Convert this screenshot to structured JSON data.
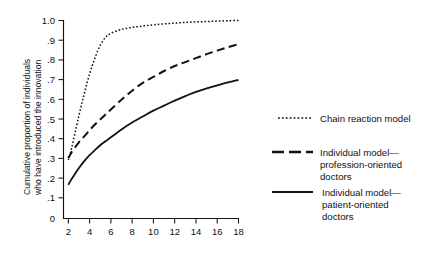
{
  "chart_data": {
    "type": "line",
    "title": "",
    "subtitle": "",
    "xlabel": "",
    "ylabel": "Cumulative proportion of individuals who have introduced the innovation",
    "ylabel_line1": "Cumulative proportion of individuals",
    "ylabel_line2": "who have introduced the innovation",
    "xlim": [
      0,
      19
    ],
    "ylim": [
      0,
      1.0
    ],
    "grid": false,
    "legend_position": "right",
    "x_ticks": [
      2,
      4,
      6,
      8,
      10,
      12,
      14,
      16,
      18
    ],
    "x_tick_labels": [
      "2",
      "4",
      "6",
      "8",
      "10",
      "12",
      "14",
      "16",
      "18"
    ],
    "y_ticks": [
      0,
      0.1,
      0.2,
      0.3,
      0.4,
      0.5,
      0.6,
      0.7,
      0.8,
      0.9,
      1.0
    ],
    "y_tick_labels": [
      "0",
      ".1",
      ".2",
      ".3",
      ".4",
      ".5",
      ".6",
      ".7",
      ".8",
      ".9",
      "1.0"
    ],
    "x": [
      2,
      2.2,
      2.5,
      3,
      3.5,
      4,
      4.5,
      5,
      5.5,
      6,
      7,
      8,
      9,
      10,
      11,
      12,
      13,
      14,
      15,
      16,
      17,
      18
    ],
    "series": [
      {
        "name": "Chain reaction model",
        "style": "dotted",
        "color": "#111111",
        "values": [
          0.295,
          0.33,
          0.4,
          0.52,
          0.63,
          0.73,
          0.81,
          0.875,
          0.915,
          0.935,
          0.955,
          0.965,
          0.972,
          0.978,
          0.983,
          0.987,
          0.99,
          0.993,
          0.995,
          0.997,
          0.999,
          1.0
        ]
      },
      {
        "name": "Individual model—profession-oriented doctors",
        "name_line1": "Individual model—",
        "name_line2": "profession-oriented",
        "name_line3": "doctors",
        "style": "dashed",
        "color": "#111111",
        "values": [
          0.305,
          0.325,
          0.35,
          0.385,
          0.415,
          0.445,
          0.475,
          0.5,
          0.525,
          0.55,
          0.6,
          0.645,
          0.685,
          0.715,
          0.745,
          0.77,
          0.79,
          0.81,
          0.83,
          0.848,
          0.865,
          0.88
        ]
      },
      {
        "name": "Individual model—patient-oriented doctors",
        "name_line1": "Individual model—",
        "name_line2": "patient-oriented",
        "name_line3": "doctors",
        "style": "solid",
        "color": "#111111",
        "values": [
          0.17,
          0.19,
          0.215,
          0.255,
          0.29,
          0.32,
          0.345,
          0.37,
          0.39,
          0.41,
          0.45,
          0.485,
          0.515,
          0.545,
          0.57,
          0.595,
          0.618,
          0.64,
          0.657,
          0.672,
          0.687,
          0.7
        ]
      }
    ],
    "legend": [
      {
        "label": "Chain reaction model",
        "lines": [
          "Chain reaction model"
        ],
        "style": "dotted"
      },
      {
        "label": "Individual model—profession-oriented doctors",
        "lines": [
          "Individual model—",
          "profession-oriented",
          "doctors"
        ],
        "style": "dashed"
      },
      {
        "label": "Individual model—patient-oriented doctors",
        "lines": [
          "Individual model—",
          "patient-oriented",
          "doctors"
        ],
        "style": "solid"
      }
    ]
  }
}
